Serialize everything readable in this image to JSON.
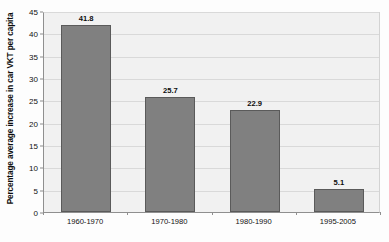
{
  "chart_data": {
    "type": "bar",
    "title": "",
    "subtitle": "",
    "xlabel": "",
    "ylabel": "Percentage average increase in car VKT per capita",
    "categories": [
      "1960-1970",
      "1970-1980",
      "1980-1990",
      "1995-2005"
    ],
    "values": [
      41.8,
      25.7,
      22.9,
      5.1
    ],
    "data_labels": [
      "41.8",
      "25.7",
      "22.9",
      "5.1"
    ],
    "ylim": [
      0,
      45
    ],
    "ytick_step": 5,
    "ytick_labels": [
      "0",
      "5",
      "10",
      "15",
      "20",
      "25",
      "30",
      "35",
      "40",
      "45"
    ],
    "grid": "horizontal",
    "legend": "none",
    "series": [
      {
        "name": "Percentage average increase in car VKT per capita",
        "values": [
          41.8,
          25.7,
          22.9,
          5.1
        ]
      }
    ],
    "colors": {
      "bar_fill": "#808080",
      "bar_border": "#5a5a5a",
      "plot_background": "#f1f1f1",
      "gridline": "#d9d9d9",
      "axis_line": "#8f8f8f",
      "text": "#0d0d0d"
    }
  }
}
